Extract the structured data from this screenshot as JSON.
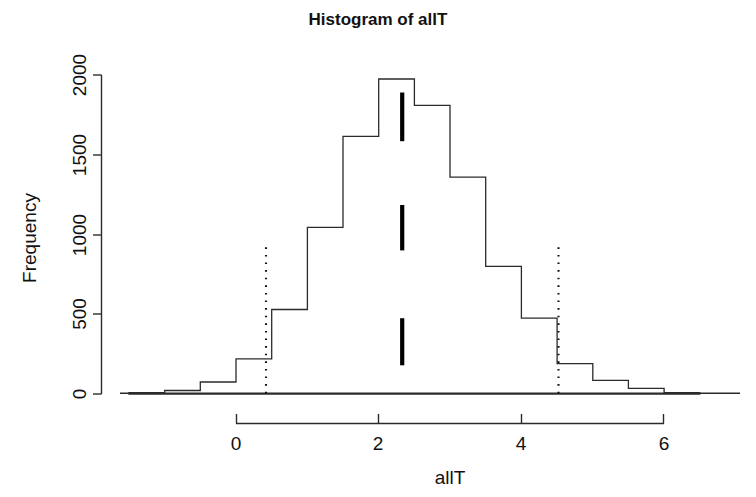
{
  "chart_data": {
    "type": "bar",
    "title": "Histogram of allT",
    "xlabel": "allT",
    "ylabel": "Frequency",
    "grid": false,
    "legend": "none",
    "bin_width": 0.5,
    "bin_edges": [
      -1.5,
      -1.0,
      -0.5,
      0.0,
      0.5,
      1.0,
      1.5,
      2.0,
      2.5,
      3.0,
      3.5,
      4.0,
      4.5,
      5.0,
      5.5,
      6.0,
      6.5
    ],
    "categories": [
      "-1.5 to -1.0",
      "-1.0 to -0.5",
      "-0.5 to 0.0",
      "0.0 to 0.5",
      "0.5 to 1.0",
      "1.0 to 1.5",
      "1.5 to 2.0",
      "2.0 to 2.5",
      "2.5 to 3.0",
      "3.0 to 3.5",
      "3.5 to 4.0",
      "4.0 to 4.5",
      "4.5 to 5.0",
      "5.0 to 5.5",
      "5.5 to 6.0",
      "6.0 to 6.5"
    ],
    "values": [
      8,
      22,
      75,
      220,
      530,
      1045,
      1615,
      1975,
      1810,
      1360,
      800,
      475,
      190,
      85,
      35,
      8
    ],
    "xlim": [
      -1.6,
      7.1
    ],
    "ylim": [
      0,
      2000
    ],
    "xticks": [
      0,
      2,
      4,
      6
    ],
    "xtick_labels": [
      "0",
      "2",
      "4",
      "6"
    ],
    "yticks": [
      0,
      500,
      1000,
      1500,
      2000
    ],
    "ytick_labels": [
      "0",
      "500",
      "1000",
      "1500",
      "2000"
    ],
    "annotations": {
      "dotted_vertical_lines": {
        "style": "dotted",
        "x_values": [
          0.42,
          4.52
        ],
        "y_top": 920,
        "y_bottom": 0,
        "description": "confidence interval bounds"
      },
      "marker_segments": {
        "style": "thick-solid-vertical",
        "x": 2.33,
        "segments": [
          {
            "y_bottom": 1585,
            "y_top": 1890
          },
          {
            "y_bottom": 900,
            "y_top": 1185
          },
          {
            "y_bottom": 180,
            "y_top": 475
          }
        ],
        "description": "observed test statistic markers"
      }
    }
  },
  "axes": {
    "y_title": "Frequency",
    "x_title": "allT"
  }
}
